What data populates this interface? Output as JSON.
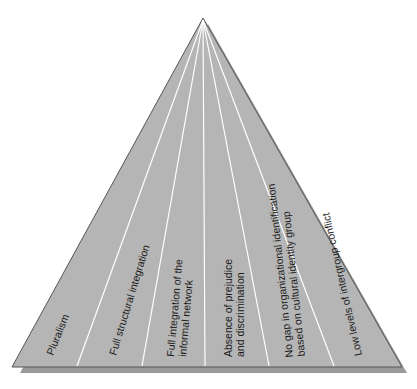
{
  "diagram": {
    "type": "pyramid",
    "apex": {
      "x": 203,
      "y": 18
    },
    "base": {
      "left_x": 12,
      "right_x": 402,
      "y": 367
    },
    "divider_base_x": [
      77,
      142,
      205,
      269,
      334
    ],
    "colors": {
      "fill": "#b5b5b5",
      "outline": "#555555",
      "divider": "#ffffff",
      "shadow": "#9a9a9a",
      "text": "#1a1a1a"
    },
    "sections": [
      {
        "id": "pluralism",
        "lines": [
          "Pluralism"
        ]
      },
      {
        "id": "structural",
        "lines": [
          "Full structural integration"
        ]
      },
      {
        "id": "informal",
        "lines": [
          "Full integration of the",
          "informal network"
        ]
      },
      {
        "id": "prejudice",
        "lines": [
          "Absence of prejudice",
          "and discrimination"
        ]
      },
      {
        "id": "identification",
        "lines": [
          "No gap in organizational identification",
          "based on cultural identity group"
        ]
      },
      {
        "id": "conflict",
        "lines": [
          "Low levels of intergroup conflict"
        ]
      }
    ]
  }
}
